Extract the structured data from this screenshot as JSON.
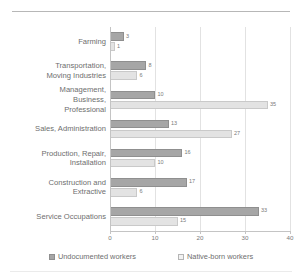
{
  "chart_data": {
    "type": "bar",
    "orientation": "horizontal",
    "title": "",
    "xlabel": "",
    "ylabel": "",
    "xlim": [
      0,
      40
    ],
    "xticks": [
      0,
      10,
      20,
      30,
      40
    ],
    "grid": true,
    "legend_position": "bottom",
    "categories": [
      "Farming",
      "Transportation,\nMoving Industries",
      "Management,\nBusiness,\nProfessional",
      "Sales, Administration",
      "Production, Repair,\nInstallation",
      "Construction and\nExtractive",
      "Service Occupations"
    ],
    "series": [
      {
        "name": "Undocumented workers",
        "color": "#a6a6a6",
        "values": [
          3,
          8,
          10,
          13,
          16,
          17,
          33
        ]
      },
      {
        "name": "Native-born workers",
        "color": "#e3e3e3",
        "values": [
          1,
          6,
          35,
          27,
          10,
          6,
          15
        ]
      }
    ]
  },
  "legend": {
    "items": [
      {
        "label": "Undocumented workers",
        "swatch": "dark"
      },
      {
        "label": "Native-born workers",
        "swatch": "light"
      }
    ]
  }
}
